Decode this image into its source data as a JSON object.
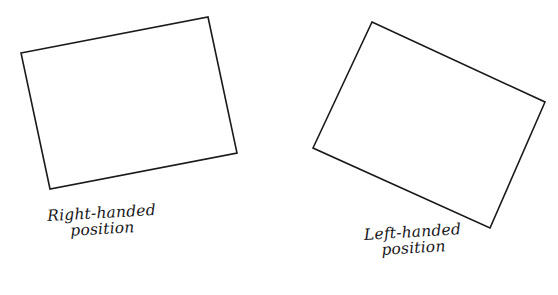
{
  "canvas": {
    "width": 558,
    "height": 295,
    "background_color": "#ffffff",
    "stroke_color": "#1a1a1a",
    "stroke_width": 1.6
  },
  "figure": {
    "style": "hand-drawn line diagram",
    "shapes": [
      {
        "id": "right-handed-sheet",
        "kind": "rotated-rectangle",
        "rotation_direction": "counter-clockwise",
        "points": "21,53 208,17 237,153 50,189",
        "corners": [
          {
            "label": "top-left",
            "x": 21,
            "y": 53
          },
          {
            "label": "top-right",
            "x": 208,
            "y": 17
          },
          {
            "label": "bottom-right",
            "x": 237,
            "y": 153
          },
          {
            "label": "bottom-left",
            "x": 50,
            "y": 189
          }
        ]
      },
      {
        "id": "left-handed-sheet",
        "kind": "rotated-rectangle",
        "rotation_direction": "clockwise",
        "points": "372,22 545,102 490,228 313,148",
        "corners": [
          {
            "label": "top",
            "x": 372,
            "y": 22
          },
          {
            "label": "right",
            "x": 545,
            "y": 102
          },
          {
            "label": "bottom",
            "x": 490,
            "y": 228
          },
          {
            "label": "left",
            "x": 313,
            "y": 148
          }
        ]
      }
    ]
  },
  "captions": {
    "right": {
      "line_1": "Right-handed",
      "line_2": "position"
    },
    "left": {
      "line_1": "Left-handed",
      "line_2": "position"
    }
  }
}
